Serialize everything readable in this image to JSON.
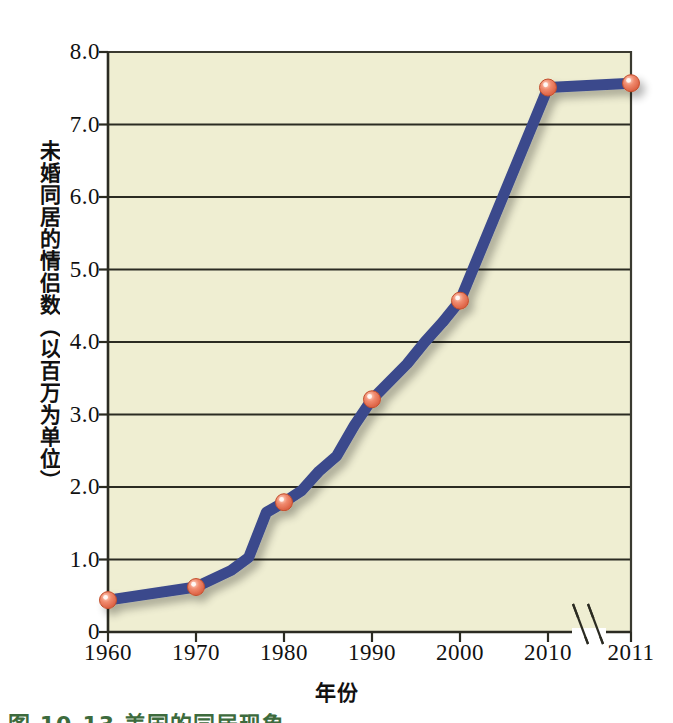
{
  "figure": {
    "caption": "图 10-13  美国的同居现象",
    "caption_color": "#3d6b3d"
  },
  "chart_data": {
    "type": "line",
    "title": "",
    "xlabel": "年份",
    "ylabel": "未婚同居的情侣数（以百万为单位）",
    "xlim": [
      1960,
      2011
    ],
    "ylim": [
      0,
      8.0
    ],
    "grid": true,
    "grid_axis": "y",
    "legend": null,
    "axis_break": {
      "axis": "x",
      "between": [
        2010,
        2011
      ],
      "symbol": "double-slash"
    },
    "xtick_labels": [
      "1960",
      "1970",
      "1980",
      "1990",
      "2000",
      "2010",
      "2011"
    ],
    "xticks": [
      1960,
      1970,
      1980,
      1990,
      2000,
      2010,
      2011
    ],
    "ytick_labels": [
      "0",
      "1.0",
      "2.0",
      "3.0",
      "4.0",
      "5.0",
      "6.0",
      "7.0",
      "8.0"
    ],
    "yticks": [
      0,
      1.0,
      2.0,
      3.0,
      4.0,
      5.0,
      6.0,
      7.0,
      8.0
    ],
    "series": [
      {
        "name": "未婚同居的情侣数",
        "line_color": "#3b4a8c",
        "marker_color": "#ee7f67",
        "marker_years": [
          1960,
          1970,
          1980,
          1990,
          2000,
          2010,
          2011
        ],
        "marker_values": [
          0.44,
          0.62,
          1.79,
          3.21,
          4.57,
          7.51,
          7.57
        ],
        "x": [
          1960,
          1970,
          1974,
          1976,
          1978,
          1980,
          1982,
          1984,
          1986,
          1988,
          1990,
          1994,
          1996,
          1998,
          2000,
          2010,
          2011
        ],
        "values": [
          0.44,
          0.62,
          0.85,
          1.03,
          1.65,
          1.79,
          1.95,
          2.22,
          2.43,
          2.85,
          3.21,
          3.7,
          4.0,
          4.27,
          4.57,
          7.51,
          7.57
        ]
      }
    ]
  },
  "style": {
    "plot_background": "#efeed2",
    "axis_color": "#3a3a30",
    "gridline_color": "#2b2b22",
    "page_background": "#ffffff"
  }
}
